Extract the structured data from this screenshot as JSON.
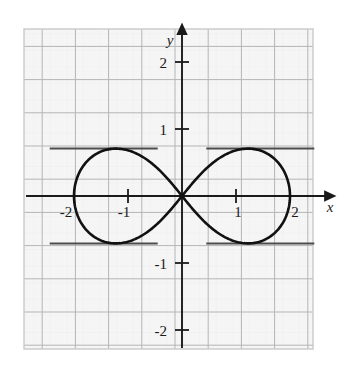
{
  "figure": {
    "name": "lemniscate-graph",
    "background_color": "#ffffff",
    "plot_background_color": "#f4f4f4",
    "grid_color": "#b9b9b9",
    "grid_minor_color": "#d8d8d8",
    "axis_color": "#1a1a1a",
    "curve_color": "#111111",
    "tangent_color": "#4d4d4d",
    "border_color": "#c9c9c9"
  },
  "axes": {
    "x_axis_label": "x",
    "y_axis_label": "y",
    "x_ticks": [
      {
        "value": -2,
        "label": "-2"
      },
      {
        "value": -1,
        "label": "-1"
      },
      {
        "value": 1,
        "label": "1"
      },
      {
        "value": 2,
        "label": "2"
      }
    ],
    "y_ticks": [
      {
        "value": 2,
        "label": "2"
      },
      {
        "value": 1,
        "label": "1"
      },
      {
        "value": -1,
        "label": "-1"
      },
      {
        "value": -2,
        "label": "-2"
      }
    ],
    "xlim": [
      -2.93,
      2.43
    ],
    "ylim": [
      -2.29,
      2.49
    ],
    "grid": true
  },
  "chart_data": {
    "type": "line",
    "title": "",
    "xlabel": "x",
    "ylabel": "y",
    "xlim": [
      -2.93,
      2.43
    ],
    "ylim": [
      -2.29,
      2.49
    ],
    "grid": true,
    "legend": null,
    "curves": [
      {
        "name": "lemniscate-of-bernoulli",
        "equation": "(x^2 + y^2)^2 = 4(x^2 - y^2)",
        "a": 2,
        "x_extent": [
          -2,
          2
        ],
        "y_extent": [
          -0.7071,
          0.7071
        ],
        "self_intersection": [
          0,
          0
        ],
        "color": "#111111",
        "width": 2.6
      }
    ],
    "annotations": [
      {
        "name": "tangent-top-left",
        "type": "horizontal-segment",
        "y": 0.7071,
        "x_start": -2.45,
        "x_end": -0.45,
        "color": "#4d4d4d"
      },
      {
        "name": "tangent-top-right",
        "type": "horizontal-segment",
        "y": 0.7071,
        "x_start": 0.45,
        "x_end": 2.45,
        "color": "#4d4d4d"
      },
      {
        "name": "tangent-bottom-left",
        "type": "horizontal-segment",
        "y": -0.7071,
        "x_start": -2.45,
        "x_end": -0.45,
        "color": "#4d4d4d"
      },
      {
        "name": "tangent-bottom-right",
        "type": "horizontal-segment",
        "y": -0.7071,
        "x_start": 0.45,
        "x_end": 2.45,
        "color": "#4d4d4d"
      }
    ],
    "x_tick_values": [
      -2,
      -1,
      1,
      2
    ],
    "x_tick_labels": [
      "-2",
      "-1",
      "1",
      "2"
    ],
    "y_tick_values": [
      2,
      1,
      -1,
      -2
    ],
    "y_tick_labels": [
      "2",
      "1",
      "-1",
      "-2"
    ]
  }
}
